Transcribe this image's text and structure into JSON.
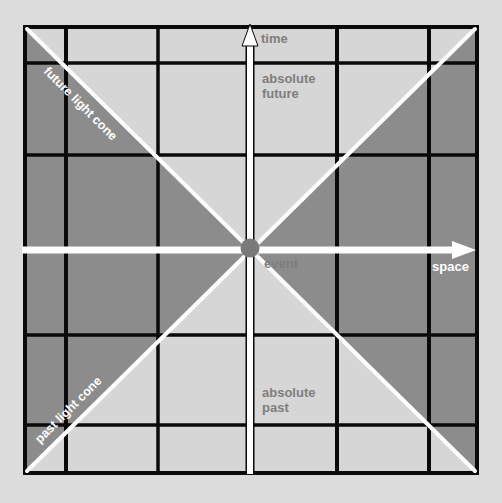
{
  "diagram": {
    "colors": {
      "background": "#dcdcdc",
      "light_region": "#d6d6d6",
      "dark_region": "#8c8c8c",
      "grid_line": "#0a0a0a",
      "cone_line": "#ffffff",
      "event_dot": "#7a7a7a",
      "label_gray": "#7e7e7e",
      "label_white": "#ffffff"
    },
    "axes": {
      "time_label": "time",
      "space_label": "space"
    },
    "regions": {
      "absolute_future_line1": "absolute",
      "absolute_future_line2": "future",
      "absolute_past_line1": "absolute",
      "absolute_past_line2": "past"
    },
    "cones": {
      "future_label": "future light cone",
      "past_label": "past light cone"
    },
    "event": {
      "label": "event"
    }
  }
}
